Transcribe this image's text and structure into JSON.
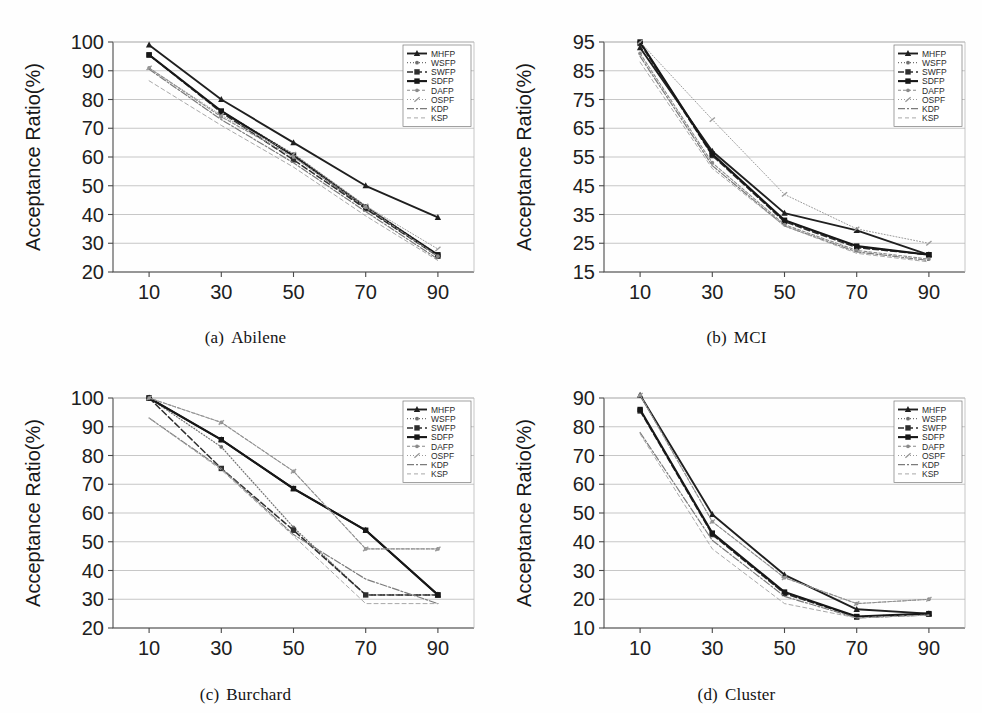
{
  "figure": {
    "xlabel": "Mean Request Bandwidth",
    "ylabel": "Acceptance Ratio(%)",
    "legend_entries": [
      "MHFP",
      "WSFP",
      "SWFP",
      "SDFP",
      "DAFP",
      "OSPF",
      "KDP",
      "KSP"
    ]
  },
  "captions": {
    "a": {
      "index": "(a)",
      "name": "Abilene"
    },
    "b": {
      "index": "(b)",
      "name": "MCI"
    },
    "c": {
      "index": "(c)",
      "name": "Burchard"
    },
    "d": {
      "index": "(d)",
      "name": "Cluster"
    }
  },
  "chart_data": [
    {
      "id": "a",
      "type": "line",
      "title": "(a) Abilene",
      "xlabel": "Mean Request Bandwidth",
      "ylabel": "Acceptance Ratio(%)",
      "x": [
        10,
        30,
        50,
        70,
        90
      ],
      "xticks": [
        "10",
        "30",
        "50",
        "70",
        "90"
      ],
      "yticks": [
        "20",
        "30",
        "40",
        "50",
        "60",
        "70",
        "80",
        "90",
        "100"
      ],
      "ylim": [
        20,
        100
      ],
      "xlim": [
        0,
        100
      ],
      "grid": true,
      "legend_position": "top-right",
      "series": [
        {
          "name": "MHFP",
          "values": [
            99,
            80,
            65,
            50,
            39
          ]
        },
        {
          "name": "WSFP",
          "values": [
            95.5,
            76,
            61,
            43,
            26
          ]
        },
        {
          "name": "SWFP",
          "values": [
            95.5,
            75.5,
            59,
            42,
            25.5
          ]
        },
        {
          "name": "SDFP",
          "values": [
            95.5,
            76,
            60.5,
            42.5,
            26
          ]
        },
        {
          "name": "DAFP",
          "values": [
            91,
            74,
            60,
            42.5,
            25.5
          ]
        },
        {
          "name": "OSPF",
          "values": [
            91,
            74.5,
            61,
            43,
            28
          ]
        },
        {
          "name": "KDP",
          "values": [
            90.5,
            73,
            58,
            41,
            24.5
          ]
        },
        {
          "name": "KSP",
          "values": [
            86.5,
            71,
            56.5,
            39.5,
            24
          ]
        }
      ]
    },
    {
      "id": "b",
      "type": "line",
      "title": "(b) MCI",
      "xlabel": "Mean Request Bandwidth",
      "ylabel": "Acceptance Ratio(%)",
      "x": [
        10,
        30,
        50,
        70,
        90
      ],
      "xticks": [
        "10",
        "30",
        "50",
        "70",
        "90"
      ],
      "yticks": [
        "15",
        "25",
        "35",
        "45",
        "55",
        "65",
        "75",
        "85",
        "95"
      ],
      "ylim": [
        15,
        95
      ],
      "xlim": [
        0,
        100
      ],
      "grid": true,
      "legend_position": "top-right",
      "series": [
        {
          "name": "MHFP",
          "values": [
            93,
            57,
            35.5,
            29.5,
            21
          ]
        },
        {
          "name": "WSFP",
          "values": [
            95,
            56,
            33,
            24,
            21
          ]
        },
        {
          "name": "SWFP",
          "values": [
            94.5,
            55.5,
            32.5,
            23.5,
            21
          ]
        },
        {
          "name": "SDFP",
          "values": [
            95,
            56,
            33,
            24,
            21
          ]
        },
        {
          "name": "DAFP",
          "values": [
            91,
            53,
            31.5,
            22.5,
            19.5
          ]
        },
        {
          "name": "OSPF",
          "values": [
            95,
            68,
            42,
            30,
            25
          ]
        },
        {
          "name": "KDP",
          "values": [
            90,
            52,
            31,
            22,
            19
          ]
        },
        {
          "name": "KSP",
          "values": [
            88,
            51,
            31,
            21.5,
            18.5
          ]
        }
      ]
    },
    {
      "id": "c",
      "type": "line",
      "title": "(c) Burchard",
      "xlabel": "Mean Request Bandwidth",
      "ylabel": "Acceptance Ratio(%)",
      "x": [
        10,
        30,
        50,
        70,
        90
      ],
      "xticks": [
        "10",
        "30",
        "50",
        "70",
        "90"
      ],
      "yticks": [
        "20",
        "30",
        "40",
        "50",
        "60",
        "70",
        "80",
        "90",
        "100"
      ],
      "ylim": [
        20,
        100
      ],
      "xlim": [
        0,
        100
      ],
      "grid": true,
      "legend_position": "top-right",
      "series": [
        {
          "name": "MHFP",
          "values": [
            100,
            85.5,
            68.5,
            54,
            31.5
          ]
        },
        {
          "name": "WSFP",
          "values": [
            100,
            83,
            55,
            31.5,
            31.5
          ]
        },
        {
          "name": "SWFP",
          "values": [
            100,
            75.5,
            54,
            31.5,
            31.5
          ]
        },
        {
          "name": "SDFP",
          "values": [
            100,
            85.5,
            68.5,
            54,
            31.5
          ]
        },
        {
          "name": "DAFP",
          "values": [
            100,
            91.5,
            74.5,
            47.5,
            47.5
          ]
        },
        {
          "name": "OSPF",
          "values": [
            100,
            91.5,
            74.5,
            47.5,
            47.5
          ]
        },
        {
          "name": "KDP",
          "values": [
            93,
            75.5,
            52.5,
            37,
            28.5
          ]
        },
        {
          "name": "KSP",
          "values": [
            93,
            75,
            52,
            28.5,
            28.5
          ]
        }
      ]
    },
    {
      "id": "d",
      "type": "line",
      "title": "(d) Cluster",
      "xlabel": "Mean Request Bandwidth",
      "ylabel": "Acceptance Ratio(%)",
      "x": [
        10,
        30,
        50,
        70,
        90
      ],
      "xticks": [
        "10",
        "30",
        "50",
        "70",
        "90"
      ],
      "yticks": [
        "10",
        "20",
        "30",
        "40",
        "50",
        "60",
        "70",
        "80",
        "90"
      ],
      "ylim": [
        10,
        90
      ],
      "xlim": [
        0,
        100
      ],
      "grid": true,
      "legend_position": "top-right",
      "series": [
        {
          "name": "MHFP",
          "values": [
            91,
            49.5,
            28.5,
            16.5,
            15
          ]
        },
        {
          "name": "WSFP",
          "values": [
            86,
            43,
            22.5,
            14,
            15
          ]
        },
        {
          "name": "SWFP",
          "values": [
            85.5,
            42.5,
            22,
            13.8,
            14.8
          ]
        },
        {
          "name": "SDFP",
          "values": [
            86,
            43,
            22.5,
            14,
            15
          ]
        },
        {
          "name": "DAFP",
          "values": [
            91,
            47,
            27.5,
            18.5,
            20
          ]
        },
        {
          "name": "OSPF",
          "values": [
            91,
            47,
            27.5,
            18.5,
            20
          ]
        },
        {
          "name": "KDP",
          "values": [
            78,
            40.5,
            21,
            13.5,
            14.5
          ]
        },
        {
          "name": "KSP",
          "values": [
            77.5,
            37.5,
            18.5,
            13.5,
            14.5
          ]
        }
      ]
    }
  ],
  "style": {
    "series_styles": [
      {
        "name": "MHFP",
        "color": "#1f1f1f",
        "width": 1.9,
        "dash": "none",
        "marker": "triangle"
      },
      {
        "name": "WSFP",
        "color": "#6f6f6f",
        "width": 1.2,
        "dash": "1,2",
        "marker": "dot"
      },
      {
        "name": "SWFP",
        "color": "#2e2e2e",
        "width": 1.5,
        "dash": "6,3",
        "marker": "square"
      },
      {
        "name": "SDFP",
        "color": "#171717",
        "width": 2.1,
        "dash": "none",
        "marker": "square"
      },
      {
        "name": "DAFP",
        "color": "#8a8a8a",
        "width": 1.1,
        "dash": "3,2",
        "marker": "dot"
      },
      {
        "name": "OSPF",
        "color": "#9a9a9a",
        "width": 1.0,
        "dash": "1,2",
        "marker": "tick"
      },
      {
        "name": "KDP",
        "color": "#7b7b7b",
        "width": 1.2,
        "dash": "7,2,2,2",
        "marker": "none"
      },
      {
        "name": "KSP",
        "color": "#a8a8a8",
        "width": 1.0,
        "dash": "4,3",
        "marker": "none"
      }
    ]
  }
}
